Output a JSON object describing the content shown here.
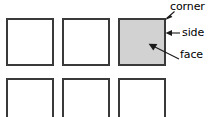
{
  "figure": {
    "background_color": "#ffffff",
    "width": 219,
    "height": 117
  },
  "colors": {
    "square_outline_stroke": "#3a3a3a",
    "square_outline_fill": "#ffffff",
    "square_shaded_fill": "#d2d2d2",
    "leader_line": "#1a1a1a",
    "text": "#000000"
  },
  "grid": {
    "rows": 2,
    "columns": 3,
    "square_size": 46,
    "column_spacing": 56,
    "row_spacing": 60,
    "origin_x": 7,
    "origin_y": 19,
    "squares": [
      {
        "name": "square-r1c1",
        "row": 1,
        "column": 1,
        "shaded": false
      },
      {
        "name": "square-r1c2",
        "row": 1,
        "column": 2,
        "shaded": false
      },
      {
        "name": "square-r1c3",
        "row": 1,
        "column": 3,
        "shaded": true
      },
      {
        "name": "square-r2c1",
        "row": 2,
        "column": 1,
        "shaded": false
      },
      {
        "name": "square-r2c2",
        "row": 2,
        "column": 2,
        "shaded": false
      },
      {
        "name": "square-r2c3",
        "row": 2,
        "column": 3,
        "shaded": false
      }
    ]
  },
  "annotations": {
    "corner": {
      "label": "corner",
      "points_to": "top-right vertex of shaded square"
    },
    "side": {
      "label": "side",
      "points_to": "right edge of shaded square"
    },
    "face": {
      "label": "face",
      "points_to": "interior of shaded square"
    }
  }
}
